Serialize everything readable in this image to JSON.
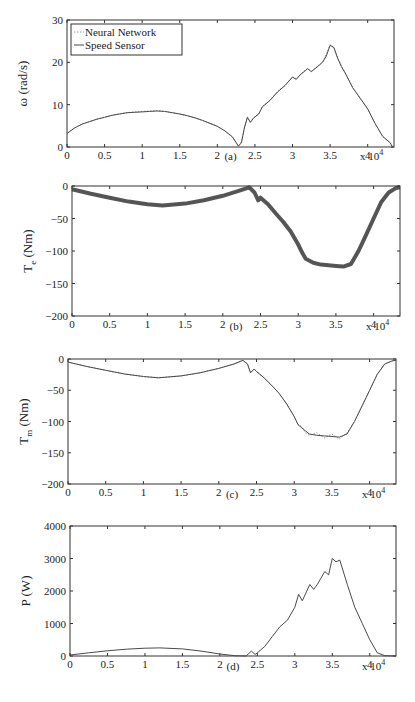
{
  "chart_data": [
    {
      "type": "line",
      "panel": "(a)",
      "title": "",
      "xlabel": "(a)",
      "ylabel": "ω (rad/s)",
      "x_multiplier": "x 10^4",
      "xlim": [
        0,
        4.35
      ],
      "ylim": [
        0,
        30
      ],
      "xticks": [
        "0",
        "0.5",
        "1",
        "1.5",
        "2",
        "2.5",
        "3",
        "3.5",
        "4"
      ],
      "yticks": [
        "0",
        "10",
        "20",
        "30"
      ],
      "legend": {
        "position": "upper-left",
        "entries": [
          "Neural Network",
          "Speed Sensor"
        ]
      },
      "x": [
        0,
        0.1,
        0.2,
        0.3,
        0.4,
        0.5,
        0.6,
        0.7,
        0.8,
        0.9,
        1.0,
        1.1,
        1.2,
        1.3,
        1.4,
        1.5,
        1.6,
        1.7,
        1.8,
        1.9,
        2.0,
        2.1,
        2.2,
        2.28,
        2.32,
        2.36,
        2.4,
        2.44,
        2.48,
        2.55,
        2.6,
        2.7,
        2.8,
        2.9,
        3.0,
        3.05,
        3.1,
        3.2,
        3.25,
        3.3,
        3.4,
        3.45,
        3.5,
        3.55,
        3.6,
        3.65,
        3.7,
        3.8,
        3.9,
        4.0,
        4.1,
        4.2,
        4.3,
        4.33
      ],
      "series": [
        {
          "name": "Speed Sensor",
          "style": "solid",
          "values": [
            3.2,
            4.5,
            5.4,
            6.0,
            6.6,
            7.0,
            7.5,
            7.8,
            8.1,
            8.2,
            8.3,
            8.4,
            8.5,
            8.4,
            8.1,
            7.8,
            7.4,
            6.9,
            6.3,
            5.6,
            4.9,
            3.8,
            2.4,
            0.2,
            1.0,
            4.5,
            7.0,
            5.8,
            6.8,
            7.8,
            9.5,
            11.0,
            13.0,
            14.5,
            16.5,
            16.0,
            17.0,
            18.5,
            17.8,
            18.5,
            20.0,
            21.5,
            24.0,
            23.5,
            21.0,
            19.0,
            17.5,
            14.0,
            11.5,
            9.0,
            5.5,
            2.5,
            1.0,
            0.0
          ]
        },
        {
          "name": "Neural Network",
          "style": "dotted",
          "values": [
            3.3,
            4.5,
            5.4,
            6.0,
            6.6,
            7.1,
            7.5,
            7.9,
            8.1,
            8.3,
            8.4,
            8.5,
            8.6,
            8.4,
            8.1,
            7.8,
            7.4,
            6.9,
            6.3,
            5.6,
            4.9,
            3.8,
            2.3,
            0.3,
            1.2,
            4.6,
            7.1,
            5.9,
            6.9,
            7.8,
            9.6,
            11.1,
            13.1,
            14.6,
            16.6,
            16.1,
            17.1,
            18.6,
            17.9,
            18.6,
            20.1,
            22.0,
            24.2,
            23.6,
            21.1,
            19.2,
            17.6,
            14.1,
            11.5,
            9.0,
            5.5,
            2.5,
            1.0,
            0.0
          ]
        }
      ]
    },
    {
      "type": "line",
      "panel": "(b)",
      "xlabel": "(b)",
      "ylabel": "T_e (Nm)",
      "x_multiplier": "x 10^4",
      "xlim": [
        0,
        4.35
      ],
      "ylim": [
        -200,
        0
      ],
      "xticks": [
        "0",
        "0.5",
        "1",
        "1.5",
        "2",
        "2.5",
        "3",
        "3.5",
        "4"
      ],
      "yticks": [
        "0",
        "-50",
        "-100",
        "-150",
        "-200"
      ],
      "x": [
        0,
        0.25,
        0.5,
        0.75,
        1.0,
        1.2,
        1.5,
        1.75,
        2.0,
        2.2,
        2.35,
        2.42,
        2.47,
        2.5,
        2.6,
        2.7,
        2.8,
        2.9,
        3.0,
        3.05,
        3.1,
        3.2,
        3.3,
        3.4,
        3.5,
        3.6,
        3.7,
        3.8,
        3.9,
        4.0,
        4.1,
        4.2,
        4.3,
        4.35
      ],
      "series": [
        {
          "name": "Speed Sensor",
          "style": "solid-thick",
          "values": [
            -5,
            -12,
            -18,
            -24,
            -28,
            -30,
            -27,
            -22,
            -15,
            -8,
            -2,
            -10,
            -22,
            -18,
            -28,
            -42,
            -55,
            -70,
            -90,
            -102,
            -112,
            -118,
            -121,
            -122,
            -123,
            -124,
            -120,
            -100,
            -75,
            -50,
            -25,
            -10,
            -3,
            -2
          ]
        },
        {
          "name": "Neural Network",
          "style": "dotted-noisy",
          "values": [
            -4,
            -12,
            -18,
            -24,
            -28,
            -30,
            -27,
            -22,
            -15,
            -8,
            -2,
            -10,
            -22,
            -18,
            -28,
            -42,
            -55,
            -70,
            -90,
            -102,
            -112,
            -118,
            -121,
            -122,
            -123,
            -124,
            -120,
            -100,
            -75,
            -50,
            -25,
            -10,
            -3,
            -2
          ]
        }
      ]
    },
    {
      "type": "line",
      "panel": "(c)",
      "xlabel": "(c)",
      "ylabel": "T_m (Nm)",
      "x_multiplier": "x 10^4",
      "xlim": [
        0,
        4.35
      ],
      "ylim": [
        -200,
        0
      ],
      "xticks": [
        "0",
        "0.5",
        "1",
        "1.5",
        "2",
        "2.5",
        "3",
        "3.5",
        "4"
      ],
      "yticks": [
        "0",
        "-50",
        "-100",
        "-150",
        "-200"
      ],
      "x": [
        0,
        0.25,
        0.5,
        0.75,
        1.0,
        1.2,
        1.5,
        1.75,
        2.0,
        2.2,
        2.32,
        2.38,
        2.42,
        2.47,
        2.5,
        2.6,
        2.7,
        2.8,
        2.9,
        3.0,
        3.05,
        3.1,
        3.15,
        3.2,
        3.3,
        3.4,
        3.5,
        3.6,
        3.7,
        3.8,
        3.9,
        4.0,
        4.1,
        4.2,
        4.3,
        4.35
      ],
      "series": [
        {
          "name": "Speed Sensor",
          "style": "solid",
          "values": [
            -5,
            -12,
            -18,
            -24,
            -28,
            -30,
            -27,
            -22,
            -15,
            -8,
            -2,
            -8,
            -22,
            -16,
            -20,
            -30,
            -42,
            -55,
            -72,
            -92,
            -105,
            -110,
            -115,
            -120,
            -122,
            -123,
            -124,
            -125,
            -120,
            -100,
            -75,
            -50,
            -25,
            -8,
            -3,
            -2
          ]
        },
        {
          "name": "Neural Network",
          "style": "dotted",
          "values": [
            -5,
            -12,
            -18,
            -24,
            -28,
            -30,
            -27,
            -22,
            -15,
            -8,
            -2,
            -8,
            -22,
            -16,
            -20,
            -30,
            -42,
            -55,
            -72,
            -92,
            -105,
            -108,
            -118,
            -122,
            -118,
            -126,
            -120,
            -128,
            -118,
            -100,
            -75,
            -50,
            -25,
            -8,
            -3,
            -2
          ]
        }
      ]
    },
    {
      "type": "line",
      "panel": "(d)",
      "xlabel": "(d)",
      "ylabel": "P (W)",
      "x_multiplier": "x 10^4",
      "xlim": [
        0,
        4.35
      ],
      "ylim": [
        0,
        4000
      ],
      "xticks": [
        "0",
        "0.5",
        "1",
        "1.5",
        "2",
        "2.5",
        "3",
        "3.5",
        "4"
      ],
      "yticks": [
        "0",
        "1000",
        "2000",
        "3000",
        "4000"
      ],
      "x": [
        0,
        0.25,
        0.5,
        0.75,
        1.0,
        1.2,
        1.5,
        1.75,
        2.0,
        2.2,
        2.35,
        2.42,
        2.47,
        2.5,
        2.6,
        2.7,
        2.8,
        2.9,
        3.0,
        3.05,
        3.1,
        3.2,
        3.25,
        3.3,
        3.4,
        3.45,
        3.5,
        3.55,
        3.6,
        3.7,
        3.8,
        3.9,
        4.0,
        4.1,
        4.2,
        4.35
      ],
      "series": [
        {
          "name": "P",
          "style": "solid",
          "values": [
            30,
            100,
            160,
            210,
            240,
            250,
            220,
            150,
            60,
            10,
            0,
            150,
            50,
            100,
            300,
            600,
            900,
            1100,
            1500,
            1900,
            1700,
            2200,
            2050,
            2200,
            2600,
            2500,
            3000,
            2900,
            2950,
            2200,
            1500,
            1000,
            500,
            100,
            10,
            0
          ]
        }
      ]
    }
  ],
  "colors": {
    "axis": "#333333",
    "line": "#4a4a4a",
    "nn_line": "#9a9a9a",
    "background": "#ffffff"
  }
}
